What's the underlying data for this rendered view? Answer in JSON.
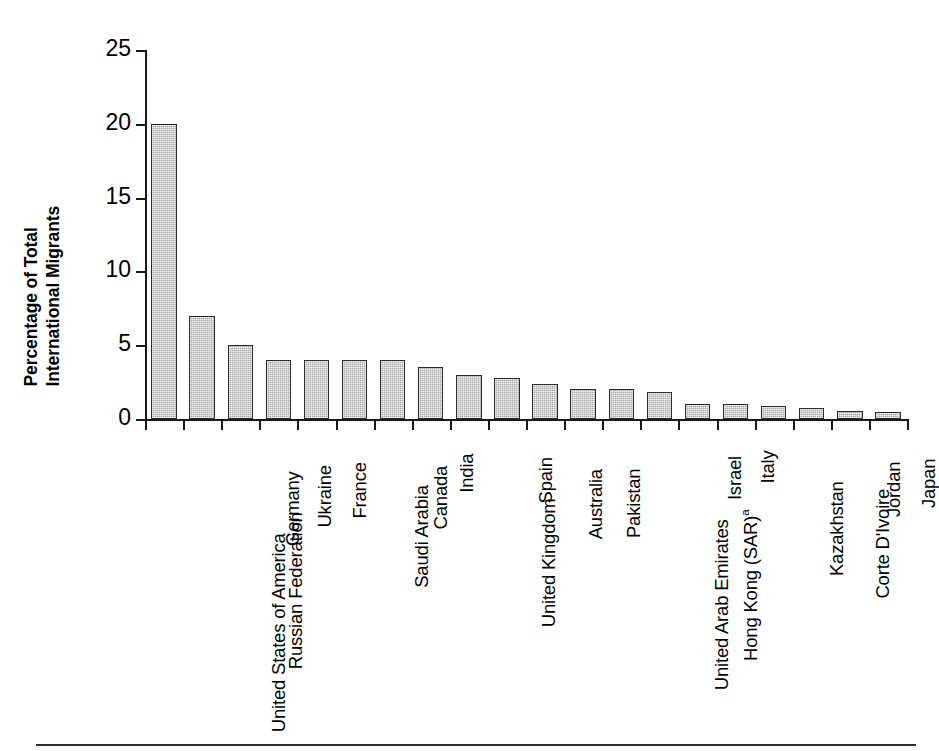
{
  "chart_data": {
    "type": "bar",
    "title": "",
    "subtitle": "",
    "xlabel": "",
    "ylabel": "Percentage of Total International Migrants",
    "ylabel_lines": [
      "Percentage of Total",
      "International Migrants"
    ],
    "ylim": [
      0,
      25
    ],
    "yticks": [
      0,
      5,
      10,
      15,
      20,
      25
    ],
    "ytick_labels": [
      "0",
      "5",
      "10",
      "15",
      "20",
      "25"
    ],
    "grid": false,
    "legend": null,
    "legend_position": "none",
    "bar_fill_color": "#a8a8a8",
    "bar_edge_color": "#2b2b2b",
    "axis_color": "#1a1a1a",
    "categories": [
      "United States of America",
      "Russian Federation",
      "Germany",
      "Ukraine",
      "France",
      "Saudi Arabia",
      "Canada",
      "India",
      "United Kingdom",
      "Spain",
      "Australia",
      "Pakistan",
      "United Arab Emirates",
      "Hong Kong (SAR)",
      "Israel",
      "Italy",
      "Kazakhstan",
      "Corte D'Ivoire",
      "Jordan",
      "Japan"
    ],
    "category_footnotes": {
      "Hong Kong (SAR)": "a"
    },
    "values": [
      20.0,
      7.0,
      5.0,
      4.0,
      4.0,
      4.0,
      4.0,
      3.5,
      3.0,
      2.8,
      2.4,
      2.0,
      2.0,
      1.85,
      1.0,
      1.0,
      0.9,
      0.75,
      0.55,
      0.45
    ],
    "annotations": []
  }
}
